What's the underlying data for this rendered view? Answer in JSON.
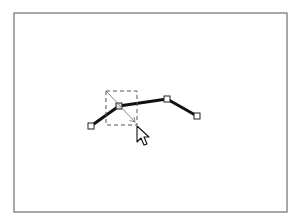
{
  "canvas": {
    "frame": {
      "x": 14,
      "y": 13,
      "width": 273,
      "height": 199,
      "stroke": "#6e6e6e"
    },
    "polyline": {
      "stroke": "#111111",
      "points": [
        [
          91,
          126
        ],
        [
          119,
          106
        ],
        [
          167,
          99
        ],
        [
          197,
          116
        ]
      ]
    },
    "handles": [
      {
        "x": 91,
        "y": 126
      },
      {
        "x": 119,
        "y": 106
      },
      {
        "x": 167,
        "y": 99
      },
      {
        "x": 197,
        "y": 116
      }
    ],
    "selection_box": {
      "x": 106,
      "y": 91,
      "width": 31,
      "height": 34,
      "stroke": "#555555"
    },
    "drag_arrow": {
      "x1": 107,
      "y1": 92,
      "x2": 135,
      "y2": 122,
      "stroke": "#888888"
    },
    "cursor": {
      "x": 137,
      "y": 126
    }
  }
}
